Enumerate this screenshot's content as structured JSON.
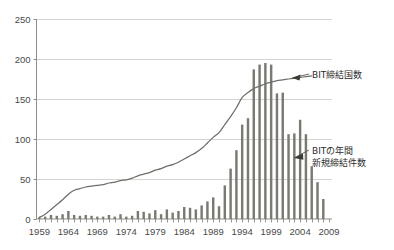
{
  "chart_data": {
    "type": "bar",
    "title": "",
    "subtitle": "",
    "xlabel": "",
    "ylabel": "",
    "xlim": [
      1958.5,
      2009.5
    ],
    "ylim": [
      0,
      250
    ],
    "grid": true,
    "legend_position": "annotations",
    "x": [
      1959,
      1960,
      1961,
      1962,
      1963,
      1964,
      1965,
      1966,
      1967,
      1968,
      1969,
      1970,
      1971,
      1972,
      1973,
      1974,
      1975,
      1976,
      1977,
      1978,
      1979,
      1980,
      1981,
      1982,
      1983,
      1984,
      1985,
      1986,
      1987,
      1988,
      1989,
      1990,
      1991,
      1992,
      1993,
      1994,
      1995,
      1996,
      1997,
      1998,
      1999,
      2000,
      2001,
      2002,
      2003,
      2004,
      2005,
      2006,
      2007,
      2008
    ],
    "categories": [
      "1959",
      "1960",
      "1961",
      "1962",
      "1963",
      "1964",
      "1965",
      "1966",
      "1967",
      "1968",
      "1969",
      "1970",
      "1971",
      "1972",
      "1973",
      "1974",
      "1975",
      "1976",
      "1977",
      "1978",
      "1979",
      "1980",
      "1981",
      "1982",
      "1983",
      "1984",
      "1985",
      "1986",
      "1987",
      "1988",
      "1989",
      "1990",
      "1991",
      "1992",
      "1993",
      "1994",
      "1995",
      "1996",
      "1997",
      "1998",
      "1999",
      "2000",
      "2001",
      "2002",
      "2003",
      "2004",
      "2005",
      "2006",
      "2007",
      "2008"
    ],
    "series": [
      {
        "name": "BITの年間新規締結件数",
        "type": "bar",
        "color": "#7a7a72",
        "values": [
          2,
          3,
          5,
          4,
          6,
          10,
          5,
          4,
          5,
          4,
          3,
          3,
          5,
          3,
          6,
          3,
          4,
          10,
          9,
          7,
          11,
          6,
          12,
          8,
          10,
          15,
          14,
          12,
          17,
          22,
          27,
          16,
          42,
          63,
          86,
          118,
          126,
          187,
          193,
          195,
          193,
          157,
          158,
          106,
          107,
          124,
          106,
          66,
          46,
          25
        ]
      },
      {
        "name": "BIT締結国数",
        "type": "line",
        "color": "#6e6e68",
        "values": [
          2,
          6,
          12,
          18,
          24,
          31,
          36,
          38,
          40,
          41,
          42,
          43,
          45,
          46,
          48,
          49,
          51,
          54,
          56,
          58,
          61,
          63,
          66,
          68,
          71,
          75,
          79,
          83,
          88,
          95,
          102,
          108,
          118,
          128,
          139,
          152,
          158,
          163,
          166,
          169,
          171,
          173,
          174,
          175,
          176,
          177,
          178,
          179,
          null,
          null
        ]
      }
    ],
    "yticks": [
      0,
      50,
      100,
      150,
      200,
      250
    ],
    "ytick_labels": [
      "0",
      "50",
      "100",
      "150",
      "200",
      "250"
    ],
    "xticks": [
      1959,
      1964,
      1969,
      1974,
      1979,
      1984,
      1989,
      1994,
      1999,
      2004,
      2009
    ],
    "xtick_labels": [
      "1959",
      "1964",
      "1969",
      "1974",
      "1979",
      "1984",
      "1989",
      "1994",
      "1999",
      "2004",
      "2009"
    ],
    "annotations": [
      {
        "id": "annotation-line",
        "text": "BIT締結国数",
        "target": "line-series",
        "text_x": 312,
        "text_y": 76
      },
      {
        "id": "annotation-bars",
        "text_line1": "BITの年間",
        "text_line2": "新規締結件数",
        "target": "bar-series",
        "text_x": 312,
        "text_y": 155
      }
    ]
  },
  "style": {
    "bar_color": "#7a7a72",
    "line_color": "#6e6e68",
    "grid_color": "#c9c9c4",
    "axis_color": "#8f8f88",
    "tick_label_color": "#4a4a4a",
    "annotation_color": "#2b2b2b",
    "background": "#ffffff"
  }
}
